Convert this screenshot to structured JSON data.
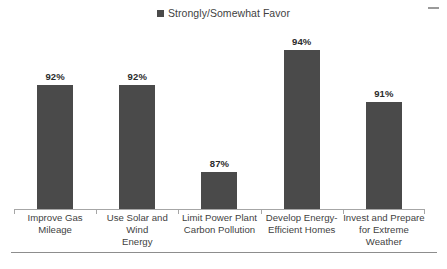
{
  "legend": {
    "marker": "filled-square",
    "label": "Strongly/Somewhat Favor",
    "color": "#4a4a4a"
  },
  "corner_mark": "dash-mark",
  "chart_data": {
    "type": "bar",
    "title": "",
    "subtitle": "",
    "xlabel": "",
    "ylabel": "",
    "categories": [
      "Improve Gas Mileage",
      "Use Solar and Wind Energy",
      "Limit Power Plant Carbon Pollution",
      "Develop Energy-Efficient Homes",
      "Invest and Prepare for Extreme Weather"
    ],
    "category_lines": [
      [
        "Improve Gas Mileage"
      ],
      [
        "Use Solar and Wind",
        "Energy"
      ],
      [
        "Limit Power Plant",
        "Carbon Pollution"
      ],
      [
        "Develop Energy-",
        "Efficient Homes"
      ],
      [
        "Invest and Prepare",
        "for Extreme Weather"
      ]
    ],
    "series": [
      {
        "name": "Strongly/Somewhat Favor",
        "values": [
          92,
          92,
          87,
          94,
          91
        ],
        "color": "#4a4a4a"
      }
    ],
    "data_labels": [
      "92%",
      "92%",
      "87%",
      "94%",
      "91%"
    ],
    "ylim": [
      84.8,
      95.4
    ],
    "grid": false,
    "legend_position": "top-center",
    "axis_line_color": "#a6a6a6",
    "bar_color": "#4a4a4a"
  }
}
